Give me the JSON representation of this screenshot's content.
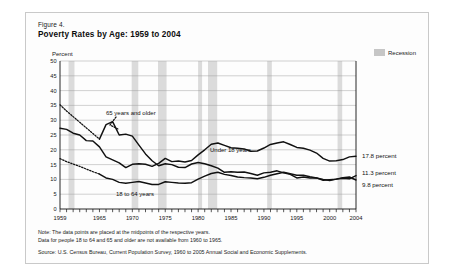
{
  "figure": {
    "number": "Figure 4.",
    "title": "Poverty Rates by Age:  1959 to 2004",
    "unit_label": "Percent"
  },
  "legend": {
    "recession_label": "Recession",
    "recession_color": "#c6c6c6"
  },
  "annotations": {
    "older": "65 years and older",
    "under18": "Under 18 years",
    "adults": "18 to 64 years"
  },
  "end_labels": {
    "under18": "17.8 percent",
    "older": "11.3 percent",
    "adults": "9.8 percent"
  },
  "notes": {
    "line1": "Note:  The data points are placed at the midpoints of the respective years.",
    "line2": "Data for people 18 to 64 and 65 and older are not available from 1960 to 1965."
  },
  "source": "Source:  U.S. Census Bureau, Current Population Survey, 1960 to 2005 Annual Social and Economic Supplements.",
  "chart_data": {
    "type": "line",
    "title": "Poverty Rates by Age:  1959 to 2004",
    "xlabel": "",
    "ylabel": "Percent",
    "xlim": [
      1959,
      2004
    ],
    "ylim": [
      0,
      50
    ],
    "ytick_step": 5,
    "yticks": [
      0,
      5,
      10,
      15,
      20,
      25,
      30,
      35,
      40,
      45,
      50
    ],
    "xticks": [
      1959,
      1965,
      1970,
      1975,
      1980,
      1985,
      1990,
      1995,
      2000,
      2004
    ],
    "grid": true,
    "legend_position": "top-right",
    "x": [
      1959,
      1960,
      1961,
      1962,
      1963,
      1964,
      1965,
      1966,
      1967,
      1968,
      1969,
      1970,
      1971,
      1972,
      1973,
      1974,
      1975,
      1976,
      1977,
      1978,
      1979,
      1980,
      1981,
      1982,
      1983,
      1984,
      1985,
      1986,
      1987,
      1988,
      1989,
      1990,
      1991,
      1992,
      1993,
      1994,
      1995,
      1996,
      1997,
      1998,
      1999,
      2000,
      2001,
      2002,
      2003,
      2004
    ],
    "series": [
      {
        "name": "Under 18 years",
        "style": "solid",
        "values": [
          27.3,
          26.9,
          25.6,
          25.0,
          23.1,
          23.0,
          21.0,
          17.6,
          16.6,
          15.6,
          14.0,
          15.1,
          15.3,
          15.1,
          14.4,
          15.4,
          17.1,
          16.0,
          16.2,
          15.9,
          16.4,
          18.3,
          20.0,
          21.9,
          22.3,
          21.5,
          20.7,
          20.5,
          20.3,
          19.5,
          19.6,
          20.6,
          21.8,
          22.3,
          22.7,
          21.8,
          20.8,
          20.5,
          19.9,
          18.9,
          17.1,
          16.2,
          16.3,
          16.7,
          17.6,
          17.8
        ],
        "end_value": 17.8
      },
      {
        "name": "65 years and older",
        "style": "dotted-then-solid",
        "dotted_through": 1965,
        "values": [
          35.2,
          33.1,
          31.2,
          29.3,
          27.4,
          25.5,
          23.6,
          28.5,
          29.5,
          25.0,
          25.3,
          24.6,
          21.6,
          18.6,
          16.3,
          14.6,
          15.3,
          15.0,
          14.1,
          14.0,
          15.2,
          15.7,
          15.3,
          14.6,
          13.8,
          12.4,
          12.6,
          12.4,
          12.5,
          12.0,
          11.4,
          12.2,
          12.4,
          12.9,
          12.2,
          11.7,
          10.5,
          10.8,
          10.5,
          10.5,
          9.7,
          9.9,
          10.1,
          10.4,
          10.2,
          11.3
        ],
        "end_value": 11.3
      },
      {
        "name": "18 to 64 years",
        "style": "dotted-then-solid",
        "dotted_through": 1965,
        "values": [
          17.0,
          16.0,
          15.2,
          14.4,
          13.5,
          12.6,
          11.8,
          10.5,
          10.0,
          9.0,
          8.7,
          9.0,
          9.3,
          8.8,
          8.3,
          8.3,
          9.2,
          9.0,
          8.8,
          8.7,
          8.9,
          10.1,
          11.1,
          12.0,
          12.4,
          11.7,
          11.3,
          10.8,
          10.6,
          10.5,
          10.2,
          10.7,
          11.4,
          11.9,
          12.4,
          11.9,
          11.4,
          11.4,
          10.9,
          10.5,
          10.0,
          9.6,
          10.1,
          10.6,
          10.8,
          9.8
        ],
        "end_value": 9.8
      }
    ],
    "recessions": [
      {
        "start": 1960.3,
        "end": 1961.2
      },
      {
        "start": 1969.9,
        "end": 1970.9
      },
      {
        "start": 1973.9,
        "end": 1975.2
      },
      {
        "start": 1980.0,
        "end": 1980.6
      },
      {
        "start": 1981.5,
        "end": 1982.9
      },
      {
        "start": 1990.5,
        "end": 1991.2
      },
      {
        "start": 2001.2,
        "end": 2001.9
      }
    ]
  }
}
